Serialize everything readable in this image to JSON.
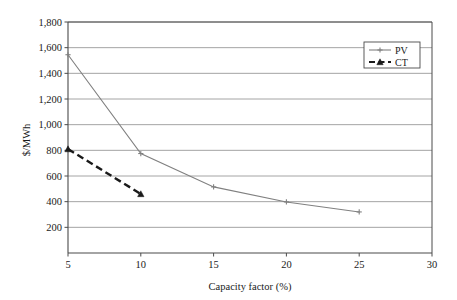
{
  "chart_data": {
    "type": "line",
    "title": "",
    "xlabel": "Capacity factor (%)",
    "ylabel": "$/MWh",
    "xlim": [
      5,
      30
    ],
    "ylim": [
      0,
      1800
    ],
    "xticks": [
      5,
      10,
      15,
      20,
      25,
      30
    ],
    "xtick_labels": [
      "5",
      "10",
      "15",
      "20",
      "25",
      "30"
    ],
    "yticks": [
      200,
      400,
      600,
      800,
      1000,
      1200,
      1400,
      1600,
      1800
    ],
    "ytick_labels": [
      "200",
      "400",
      "600",
      "800",
      "1,000",
      "1,200",
      "1,400",
      "1,600",
      "1,800"
    ],
    "grid": "horizontal",
    "legend_position": "top-right",
    "series": [
      {
        "name": "PV",
        "color": "#808080",
        "dash": "none",
        "marker": "plus",
        "x": [
          5,
          10,
          15,
          20,
          25
        ],
        "values": [
          1545,
          775,
          515,
          398,
          320
        ]
      },
      {
        "name": "CT",
        "color": "#1a1a1a",
        "dash": "dashed",
        "marker": "triangle",
        "x": [
          5,
          10
        ],
        "values": [
          810,
          460
        ]
      }
    ]
  },
  "legend": {
    "entries": [
      {
        "label": "PV"
      },
      {
        "label": "CT"
      }
    ]
  },
  "axes": {
    "x_title": "Capacity factor (%)",
    "y_title": "$/MWh"
  }
}
